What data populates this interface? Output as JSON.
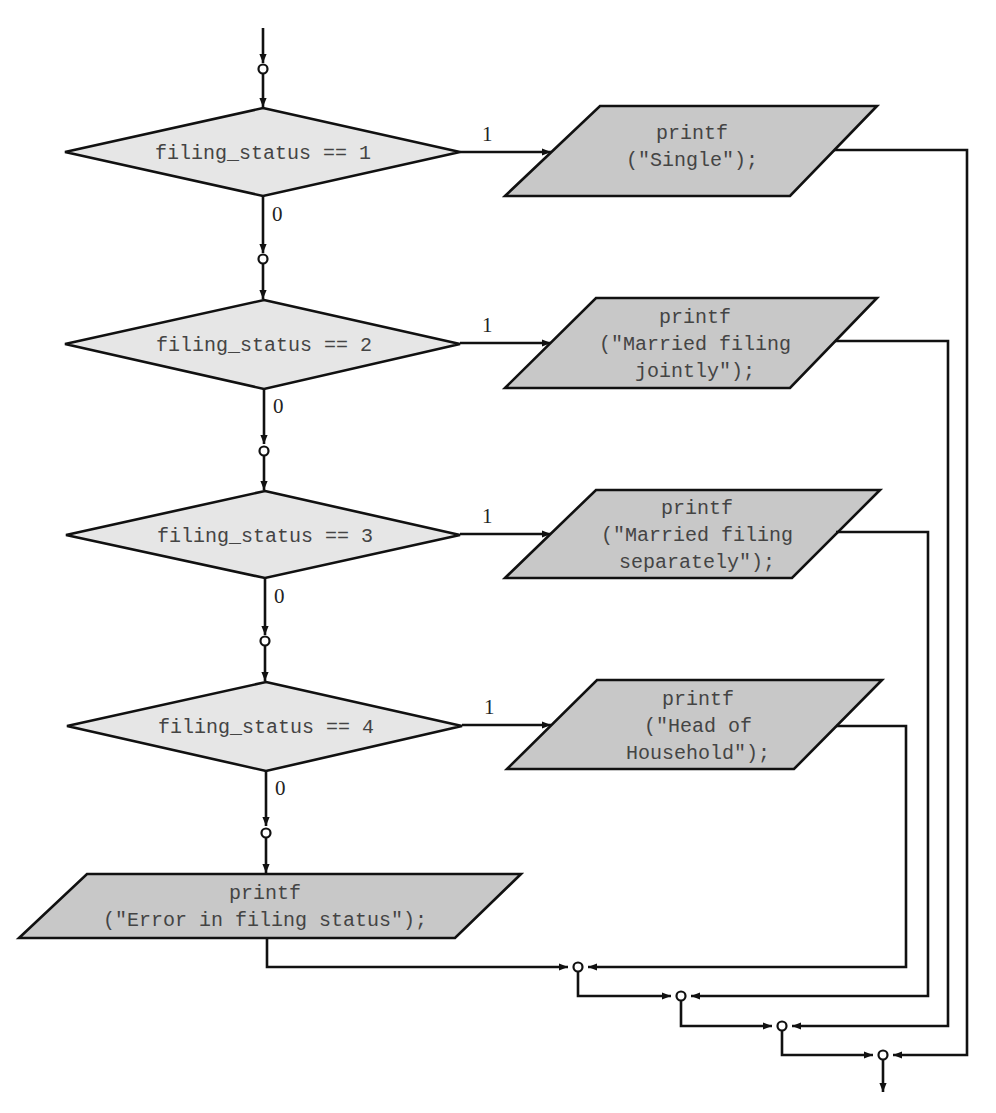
{
  "diagram": {
    "type": "flowchart",
    "decisions": [
      {
        "id": "d1",
        "condition": "filing_status == 1",
        "true_label": "1",
        "false_label": "0"
      },
      {
        "id": "d2",
        "condition": "filing_status == 2",
        "true_label": "1",
        "false_label": "0"
      },
      {
        "id": "d3",
        "condition": "filing_status == 3",
        "true_label": "1",
        "false_label": "0"
      },
      {
        "id": "d4",
        "condition": "filing_status == 4",
        "true_label": "1",
        "false_label": "0"
      }
    ],
    "outputs": [
      {
        "id": "o1",
        "lines": [
          "printf",
          "(\"Single\");"
        ]
      },
      {
        "id": "o2",
        "lines": [
          "printf",
          "(\"Married filing",
          "jointly\");"
        ]
      },
      {
        "id": "o3",
        "lines": [
          "printf",
          "(\"Married filing",
          "separately\");"
        ]
      },
      {
        "id": "o4",
        "lines": [
          "printf",
          "(\"Head of",
          "Household\");"
        ]
      },
      {
        "id": "o5",
        "lines": [
          "printf",
          "(\"Error in filing status\");"
        ]
      }
    ],
    "connectors": 9,
    "colors": {
      "decision_fill": "#e6e6e6",
      "output_fill": "#c8c8c8",
      "stroke": "#111111"
    }
  }
}
